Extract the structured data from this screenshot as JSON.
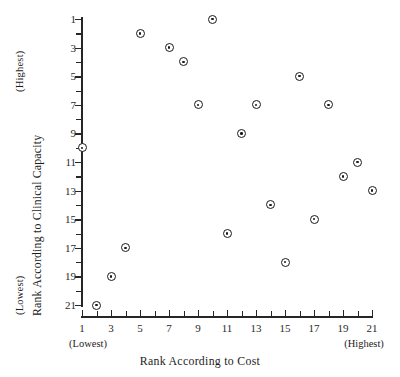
{
  "chart_data": {
    "type": "scatter",
    "title": "",
    "xlabel": "Rank According to Cost",
    "ylabel": "Rank According to Clinical Capacity",
    "x_axis_low_label": "(Lowest)",
    "x_axis_high_label": "(Highest)",
    "y_axis_high_label": "(Highest)",
    "y_axis_low_label": "(Lowest)",
    "xlim": [
      1,
      21
    ],
    "ylim": [
      1,
      21
    ],
    "y_inverted": true,
    "grid": false,
    "legend": null,
    "x_ticks": [
      1,
      2,
      3,
      4,
      5,
      6,
      7,
      8,
      9,
      10,
      11,
      12,
      13,
      14,
      15,
      16,
      17,
      18,
      19,
      20,
      21
    ],
    "x_tick_labels": [
      "1",
      "",
      "3",
      "",
      "5",
      "",
      "7",
      "",
      "9",
      "",
      "11",
      "",
      "13",
      "",
      "15",
      "",
      "17",
      "",
      "19",
      "",
      "21"
    ],
    "y_ticks": [
      1,
      2,
      3,
      4,
      5,
      6,
      7,
      8,
      9,
      10,
      11,
      12,
      13,
      14,
      15,
      16,
      17,
      18,
      19,
      20,
      21
    ],
    "y_tick_labels": [
      "1",
      "",
      "3",
      "",
      "5",
      "",
      "7",
      "",
      "9",
      "",
      "11",
      "",
      "13",
      "",
      "15",
      "",
      "17",
      "",
      "19",
      "",
      "21"
    ],
    "marker": "bullseye-circle",
    "marker_color": "#1a1a1a",
    "points": [
      {
        "x": 1,
        "y": 10
      },
      {
        "x": 2,
        "y": 21
      },
      {
        "x": 3,
        "y": 19
      },
      {
        "x": 4,
        "y": 17
      },
      {
        "x": 5,
        "y": 2
      },
      {
        "x": 7,
        "y": 3
      },
      {
        "x": 8,
        "y": 4
      },
      {
        "x": 9,
        "y": 7
      },
      {
        "x": 10,
        "y": 1
      },
      {
        "x": 11,
        "y": 16
      },
      {
        "x": 12,
        "y": 9
      },
      {
        "x": 13,
        "y": 7
      },
      {
        "x": 14,
        "y": 14
      },
      {
        "x": 15,
        "y": 18
      },
      {
        "x": 16,
        "y": 5
      },
      {
        "x": 17,
        "y": 15
      },
      {
        "x": 18,
        "y": 7
      },
      {
        "x": 19,
        "y": 12
      },
      {
        "x": 20,
        "y": 11
      },
      {
        "x": 21,
        "y": 13
      }
    ]
  }
}
